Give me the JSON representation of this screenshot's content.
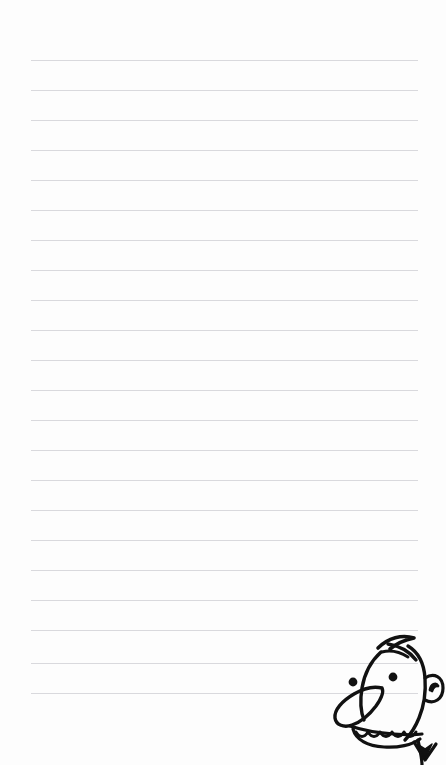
{
  "page": {
    "type": "lined-notebook-page",
    "width": 446,
    "height": 765,
    "background_color": "#fdfdfd",
    "text_content": "",
    "has_handwriting": false
  },
  "ruled_lines": {
    "count": 22,
    "color": "#d9d9dd",
    "thickness_px": 1,
    "spacing_px": 30,
    "left_margin_px": 31,
    "right_margin_px": 28,
    "first_line_y": 60,
    "last_line_y": 693,
    "y_positions": [
      60,
      90,
      120,
      150,
      180,
      210,
      240,
      270,
      300,
      330,
      360,
      390,
      420,
      450,
      480,
      510,
      540,
      570,
      600,
      630,
      663,
      693
    ]
  },
  "doodle": {
    "name": "wimpy-kid-face",
    "description": "Cartoon boy face peeking from bottom-right corner",
    "style": "black ink line drawing",
    "ink_color": "#111111",
    "position": "bottom-right",
    "features": [
      "swoosh-hair-cowlick",
      "left-eye-dot",
      "right-eye-dot",
      "large-loop-nose",
      "scalloped-teeth-mouth",
      "round-ear-with-inner-curl",
      "neck-and-collar"
    ]
  }
}
